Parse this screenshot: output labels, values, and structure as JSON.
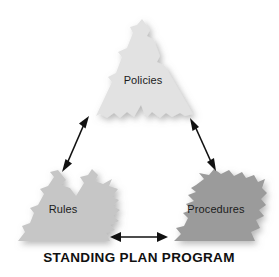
{
  "figure": {
    "title": "Standing Plan Program",
    "caption": "STANDING PLAN PROGRAM",
    "background_color": "#ffffff",
    "width": 279,
    "height": 277
  },
  "nodes": [
    {
      "id": "policies",
      "label": "Policies",
      "position": "top-center",
      "fill_color": "#e2e2e2",
      "text_color": "#1b1b1b"
    },
    {
      "id": "rules",
      "label": "Rules",
      "position": "bottom-left",
      "fill_color": "#c6c6c6",
      "text_color": "#1b1b1b"
    },
    {
      "id": "procedures",
      "label": "Procedures",
      "position": "bottom-right",
      "fill_color": "#9b9b9b",
      "text_color": "#1b1b1b"
    }
  ],
  "connectors": [
    {
      "id": "policies-rules",
      "from": "policies",
      "to": "rules",
      "style": "double-headed-arrow",
      "color": "#111111"
    },
    {
      "id": "policies-procedures",
      "from": "policies",
      "to": "procedures",
      "style": "double-headed-arrow",
      "color": "#111111"
    },
    {
      "id": "rules-procedures",
      "from": "rules",
      "to": "procedures",
      "style": "double-headed-arrow",
      "color": "#111111"
    }
  ]
}
